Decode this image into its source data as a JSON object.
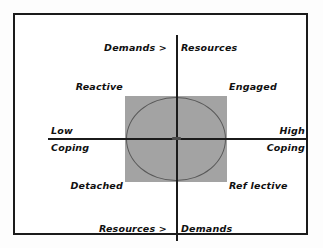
{
  "diagram": {
    "frame_color": "#1b1b1b",
    "shade_color": "#a3a3a3",
    "axes": {
      "vertical": {
        "top_label_left": "Demands >",
        "top_label_right": "Resources",
        "bottom_label_left": "Resources >",
        "bottom_label_right": "Demands"
      },
      "horizontal": {
        "left_label_top": "Low",
        "left_label_bottom": "Coping",
        "right_label_top": "High",
        "right_label_bottom": "Coping"
      }
    },
    "quadrants": {
      "top_left": "Reactive",
      "top_right": "Engaged",
      "bottom_left": "Detached",
      "bottom_right": "Ref lective"
    }
  }
}
